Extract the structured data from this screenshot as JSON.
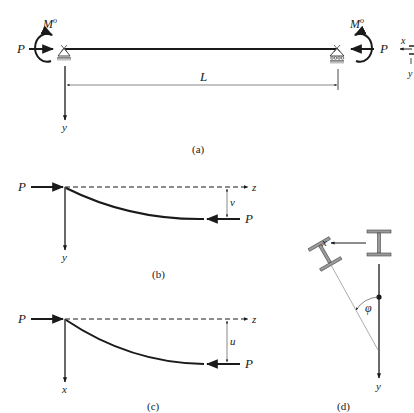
{
  "figure_a": {
    "caption": "(a)",
    "moment_left": "M",
    "moment_left_sup": "o",
    "moment_right": "M",
    "moment_right_sup": "o",
    "load_left": "P",
    "load_right": "P",
    "span": "L",
    "axis_y": "y",
    "inset_x": "x",
    "inset_y": "y"
  },
  "figure_b": {
    "caption": "(b)",
    "load_left": "P",
    "load_right": "P",
    "axis_z": "z",
    "axis_y": "y",
    "deflection": "v"
  },
  "figure_c": {
    "caption": "(c)",
    "load_left": "P",
    "load_right": "P",
    "axis_z": "z",
    "axis_x": "x",
    "deflection": "u"
  },
  "figure_d": {
    "caption": "(d)",
    "axis_x": "x",
    "axis_y": "y",
    "angle": "φ"
  },
  "colors": {
    "ink": "#1a1a1a",
    "flange": "#9a9a9a",
    "thin_line": "#888888"
  }
}
